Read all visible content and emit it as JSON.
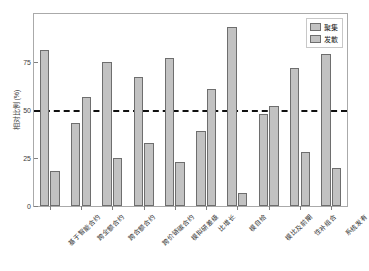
{
  "top_strip_text": "",
  "chart_data": {
    "type": "bar",
    "title": "",
    "subtitle": "",
    "xlabel": "",
    "ylabel": "相对比例 (%)",
    "ylim": [
      0,
      100
    ],
    "yticks": [
      0,
      25,
      50,
      75
    ],
    "ytick_labels": [
      "0",
      "25",
      "50",
      "75"
    ],
    "grid": false,
    "legend_position": "top-right-inside",
    "reference_line": {
      "value": 50,
      "style": "dashed",
      "color": "#111111"
    },
    "categories": [
      "基于智能合约",
      "跨全额合约",
      "跨合额合约",
      "跨价链碳合约",
      "模拟研差级",
      "比增长",
      "模自给",
      "模比及前期",
      "性补组合",
      "系统发有"
    ],
    "series": [
      {
        "name": "聚集",
        "color": "#c2c2c2",
        "values": [
          81,
          43,
          75,
          67,
          77,
          39,
          93,
          48,
          72,
          79
        ]
      },
      {
        "name": "发散",
        "color": "#c2c2c2",
        "values": [
          18,
          57,
          25,
          33,
          23,
          61,
          7,
          52,
          28,
          20
        ]
      }
    ]
  },
  "legend": {
    "items": [
      {
        "label": "聚集"
      },
      {
        "label": "发散"
      }
    ]
  },
  "colors": {
    "bar_fill": "#c2c2c2",
    "bar_edge": "#6e6e6e",
    "axis": "#aaaaaa",
    "text": "#2e2e2e",
    "refline": "#111111",
    "background": "#ffffff"
  }
}
